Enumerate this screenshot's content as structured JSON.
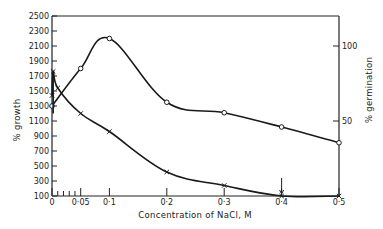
{
  "chart_data": {
    "type": "line",
    "title": "",
    "xlabel": "Concentration of NaCl,  M",
    "ylabel": "% growth",
    "y2label": "% germination",
    "xlim": [
      0,
      0.5
    ],
    "ylim": [
      100,
      2500
    ],
    "y2lim": [
      0,
      100
    ],
    "x_ticks": [
      {
        "value": 0,
        "label": "0"
      },
      {
        "value": 0.05,
        "label": "0·05"
      },
      {
        "value": 0.1,
        "label": "0·1"
      },
      {
        "value": 0.2,
        "label": "0·2"
      },
      {
        "value": 0.3,
        "label": "0·3"
      },
      {
        "value": 0.4,
        "label": "0·4"
      },
      {
        "value": 0.5,
        "label": "0·5"
      }
    ],
    "x_minor_ticks": [
      0.01,
      0.02,
      0.03,
      0.04
    ],
    "y_ticks": [
      {
        "value": 100,
        "label": "100"
      },
      {
        "value": 300,
        "label": "300"
      },
      {
        "value": 500,
        "label": "500"
      },
      {
        "value": 700,
        "label": "700"
      },
      {
        "value": 900,
        "label": "900"
      },
      {
        "value": 1100,
        "label": "1100"
      },
      {
        "value": 1300,
        "label": "1300"
      },
      {
        "value": 1500,
        "label": "1500"
      },
      {
        "value": 1700,
        "label": "1700"
      },
      {
        "value": 1900,
        "label": "1900"
      },
      {
        "value": 2100,
        "label": "2100"
      },
      {
        "value": 2300,
        "label": "2300"
      },
      {
        "value": 2500,
        "label": "2500"
      }
    ],
    "y2_ticks": [
      {
        "value": 50,
        "label": "50"
      },
      {
        "value": 100,
        "label": "100"
      }
    ],
    "grid": false,
    "series": [
      {
        "name": "% growth",
        "axis": "left",
        "marker": "circle",
        "x": [
          0,
          0.05,
          0.1,
          0.2,
          0.3,
          0.4,
          0.5
        ],
        "values": [
          1300,
          1800,
          2200,
          1350,
          1210,
          1020,
          810
        ]
      },
      {
        "name": "% germination",
        "axis": "right",
        "marker": "cross",
        "x": [
          0,
          0.002,
          0.01,
          0.05,
          0.1,
          0.2,
          0.3,
          0.4,
          0.5
        ],
        "values": [
          67,
          83,
          72,
          55,
          43,
          16,
          7,
          0,
          0
        ]
      }
    ],
    "annotations": [
      {
        "type": "arrow",
        "x": 0.4,
        "description": "downward arrow marking 0·4 M"
      },
      {
        "type": "arrow",
        "x": 0.002,
        "description": "vertical arrow near origin at germination peak"
      }
    ]
  }
}
